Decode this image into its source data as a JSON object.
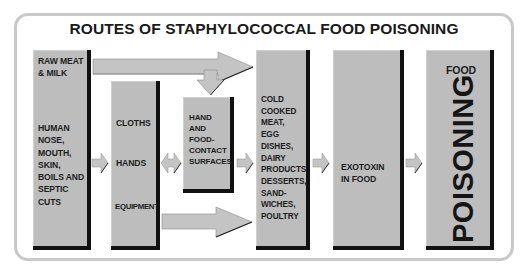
{
  "title": "ROUTES OF STAPHYLOCOCCAL FOOD POISONING",
  "boxes": {
    "sources": {
      "top_label": [
        "RAW MEAT",
        "& MILK"
      ],
      "bottom_label": [
        "HUMAN",
        "NOSE,",
        "MOUTH,",
        "SKIN,",
        "BOILS AND",
        "SEPTIC",
        "CUTS"
      ]
    },
    "vectors": {
      "items": [
        "CLOTHS",
        "HANDS",
        "EQUIPMENT"
      ]
    },
    "surfaces": {
      "label": [
        "HAND",
        "AND",
        "FOOD-",
        "CONTACT",
        "SURFACES"
      ]
    },
    "foods": {
      "label": [
        "COLD",
        "COOKED",
        "MEAT,",
        "EGG",
        "DISHES,",
        "DAIRY",
        "PRODUCTS,",
        "DESSERTS,",
        "SAND-",
        "WICHES,",
        "POULTRY"
      ]
    },
    "exotoxin": {
      "label": [
        "EXOTOXIN",
        "IN FOOD"
      ]
    },
    "outcome": {
      "small_label": "FOOD",
      "big_label": "POISONING"
    }
  },
  "colors": {
    "box_fill": "#bdbdbd",
    "box_shadow": "#111111",
    "arrow_fill": "#c4c4c4",
    "panel_border": "#c9c9c9",
    "text": "#1a1a1a"
  }
}
